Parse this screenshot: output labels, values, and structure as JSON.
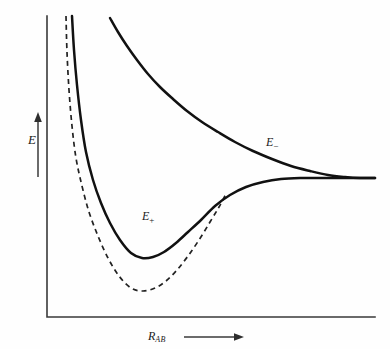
{
  "figure": {
    "background_color": "#fefefe",
    "width": 390,
    "height": 349
  },
  "axes": {
    "y_axis": {
      "label": "E",
      "label_name": "energy",
      "arrow_direction": "up",
      "arrow_icon": "up-arrow-icon",
      "x_px": 47,
      "top_px": 16,
      "bottom_px": 317
    },
    "x_axis": {
      "label_base": "R",
      "label_sub": "AB",
      "label_full": "R_AB",
      "label_name": "internuclear-distance",
      "arrow_direction": "right",
      "arrow_icon": "right-arrow-icon",
      "y_px": 317,
      "left_px": 47,
      "right_px": 375
    },
    "grid": false,
    "ticks": false,
    "tick_labels": [],
    "frame": "L-shaped",
    "axis_color": "#3a3a3a"
  },
  "labels": {
    "e_minus": {
      "base": "E",
      "sub": "−",
      "full": "E−"
    },
    "e_plus": {
      "base": "E",
      "sub": "+",
      "full": "E+"
    }
  },
  "colors": {
    "curve_solid": "#111111",
    "curve_dashed": "#222222",
    "axis": "#3a3a3a",
    "text": "#1a1a1a",
    "background": "#fefefe"
  },
  "chart_data": {
    "type": "line",
    "title": "",
    "subtitle": "",
    "xlabel": "R_AB",
    "ylabel": "E",
    "xlim": [
      0,
      1
    ],
    "ylim": [
      0,
      1
    ],
    "grid": false,
    "legend": "inline-curve-labels",
    "axis_ticks": false,
    "annotations": [
      {
        "text": "E−",
        "x_px": 266,
        "y_px": 136,
        "target": "antibonding-curve"
      },
      {
        "text": "E+",
        "x_px": 142,
        "y_px": 210,
        "target": "bonding-curve"
      }
    ],
    "asymptote_y_px": 178,
    "series": [
      {
        "name": "E−",
        "style": "solid",
        "color": "#111111",
        "description": "Antibonding orbital: purely repulsive, decays monotonically to the dissociation asymptote.",
        "points_px": [
          [
            110,
            18
          ],
          [
            118,
            32
          ],
          [
            127,
            46
          ],
          [
            137,
            60
          ],
          [
            148,
            74
          ],
          [
            160,
            87
          ],
          [
            173,
            99
          ],
          [
            187,
            111
          ],
          [
            202,
            122
          ],
          [
            218,
            132
          ],
          [
            235,
            142
          ],
          [
            253,
            151
          ],
          [
            272,
            159
          ],
          [
            291,
            166
          ],
          [
            310,
            171
          ],
          [
            328,
            175
          ],
          [
            345,
            177
          ],
          [
            360,
            178
          ],
          [
            375,
            178
          ]
        ]
      },
      {
        "name": "E+",
        "style": "solid",
        "color": "#111111",
        "description": "Bonding orbital: steep repulsive wall at short R, minimum near R_e, then rises to the same asymptote.",
        "minimum_px": [
          132,
          258
        ],
        "points_px": [
          [
            72,
            16
          ],
          [
            74,
            50
          ],
          [
            77,
            85
          ],
          [
            81,
            120
          ],
          [
            86,
            152
          ],
          [
            93,
            180
          ],
          [
            101,
            203
          ],
          [
            110,
            223
          ],
          [
            120,
            240
          ],
          [
            131,
            253
          ],
          [
            142,
            258
          ],
          [
            153,
            257
          ],
          [
            164,
            252
          ],
          [
            176,
            243
          ],
          [
            188,
            232
          ],
          [
            201,
            220
          ],
          [
            215,
            206
          ],
          [
            230,
            195
          ],
          [
            246,
            187
          ],
          [
            263,
            182
          ],
          [
            281,
            179
          ],
          [
            300,
            178
          ],
          [
            322,
            178
          ],
          [
            348,
            178
          ],
          [
            375,
            178
          ]
        ]
      },
      {
        "name": "dashed-reference",
        "style": "dashed",
        "color": "#222222",
        "description": "Dashed comparison curve with a deeper minimum that merges into the E+ curve at larger R.",
        "minimum_px": [
          128,
          290
        ],
        "points_px": [
          [
            66,
            16
          ],
          [
            67,
            52
          ],
          [
            69,
            90
          ],
          [
            72,
            126
          ],
          [
            76,
            158
          ],
          [
            82,
            186
          ],
          [
            89,
            212
          ],
          [
            98,
            236
          ],
          [
            108,
            258
          ],
          [
            119,
            276
          ],
          [
            131,
            288
          ],
          [
            143,
            291
          ],
          [
            155,
            288
          ],
          [
            166,
            281
          ],
          [
            177,
            270
          ],
          [
            188,
            256
          ],
          [
            199,
            240
          ],
          [
            210,
            222
          ],
          [
            219,
            207
          ],
          [
            226,
            194
          ]
        ]
      }
    ]
  }
}
